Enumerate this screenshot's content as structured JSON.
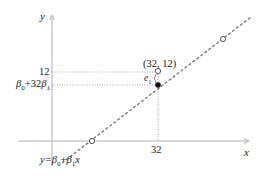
{
  "diagram": {
    "type": "simple linear regression illustration",
    "axes": {
      "x_label": "x",
      "y_label": "y",
      "x_tick": "32",
      "y_tick_observed": "12",
      "y_tick_fitted_base": "β",
      "y_tick_fitted_sub0": "0",
      "y_tick_fitted_mid": "+32",
      "y_tick_fitted_beta": "β",
      "y_tick_fitted_sub1": "1"
    },
    "point_label": "(32, 12)",
    "residual_label_base": "e",
    "residual_label_sub": "1",
    "line_label": {
      "prefix": "y=",
      "beta": "β",
      "sub0": "0",
      "plus": "+",
      "beta2": "β",
      "sub1": "1",
      "var": "x"
    },
    "colors": {
      "axis": "#b0b0b0",
      "regression_line": "#7a7a7a",
      "guide": "#8a8a8a",
      "text": "#222222",
      "open_point_fill": "#ffffff",
      "fitted_point_fill": "#111111"
    },
    "points": [
      {
        "name": "observed",
        "x": 32,
        "y": 12,
        "style": "open"
      },
      {
        "name": "fitted",
        "x": 32,
        "y": "β0+32β1",
        "style": "filled"
      },
      {
        "name": "other-upper",
        "style": "open"
      },
      {
        "name": "other-lower",
        "style": "open"
      }
    ]
  }
}
